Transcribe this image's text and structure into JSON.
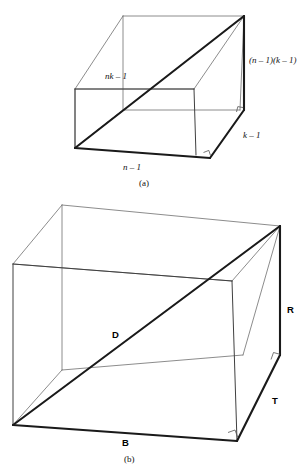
{
  "figure": {
    "title_hidden": "",
    "panels": [
      {
        "id": "a",
        "caption": "(a)",
        "caption_letter": "a",
        "labels": {
          "diagonal": "nk – 1",
          "diagonal_parts": {
            "italic": "nk",
            "rest": " – 1"
          },
          "right_face": "(n – 1)(k – 1)",
          "depth": "k – 1",
          "width": "n – 1"
        }
      },
      {
        "id": "b",
        "caption": "(b)",
        "caption_letter": "b",
        "labels": {
          "diagonal": "D",
          "right_face": "R",
          "depth": "T",
          "width": "B"
        }
      }
    ],
    "colors": {
      "bold_edge": "#1a1a1a",
      "visible_edge": "#404040",
      "hidden_edge": "#6e6e6e",
      "background": "#ffffff",
      "text": "#111111"
    }
  },
  "footer": {
    "cut_text": " "
  }
}
